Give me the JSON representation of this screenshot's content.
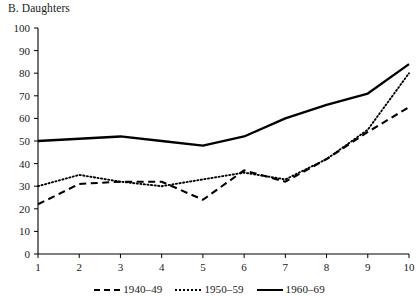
{
  "chart_data": {
    "type": "line",
    "title": "B. Daughters",
    "xlabel": "",
    "ylabel": "",
    "x": [
      1,
      2,
      3,
      4,
      5,
      6,
      7,
      8,
      9,
      10
    ],
    "categories": [
      "1",
      "2",
      "3",
      "4",
      "5",
      "6",
      "7",
      "8",
      "9",
      "10"
    ],
    "xlim": [
      1,
      10
    ],
    "ylim": [
      0,
      100
    ],
    "ytick_labels": [
      "0",
      "10",
      "20",
      "30",
      "40",
      "50",
      "60",
      "70",
      "80",
      "90",
      "100"
    ],
    "yticks": [
      0,
      10,
      20,
      30,
      40,
      50,
      60,
      70,
      80,
      90,
      100
    ],
    "grid": false,
    "legend_position": "bottom",
    "series": [
      {
        "name": "1940–49",
        "style": "dashed",
        "color": "#000000",
        "values": [
          22,
          31,
          32,
          32,
          24,
          37,
          32,
          42,
          54,
          65
        ]
      },
      {
        "name": "1950–59",
        "style": "dotted",
        "color": "#000000",
        "values": [
          30,
          35,
          32,
          30,
          33,
          36,
          33,
          42,
          55,
          80
        ]
      },
      {
        "name": "1960–69",
        "style": "solid",
        "color": "#000000",
        "values": [
          50,
          51,
          52,
          50,
          48,
          52,
          60,
          66,
          71,
          84
        ]
      }
    ]
  },
  "legend": {
    "items": [
      {
        "label": "1940–49"
      },
      {
        "label": "1950–59"
      },
      {
        "label": "1960–69"
      }
    ]
  }
}
